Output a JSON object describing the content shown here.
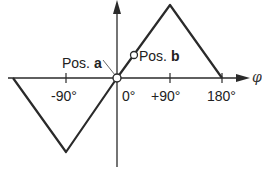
{
  "diagram": {
    "axis": {
      "x_symbol": "φ",
      "ticks": [
        {
          "label": "-90°",
          "value": -90
        },
        {
          "label": "0°",
          "value": 0
        },
        {
          "label": "+90°",
          "value": 90
        },
        {
          "label": "180°",
          "value": 180
        }
      ]
    },
    "positions": {
      "a": {
        "prefix": "Pos. ",
        "letter": "a"
      },
      "b": {
        "prefix": "Pos. ",
        "letter": "b"
      }
    },
    "curve": {
      "type": "triangular wave",
      "points_deg": [
        {
          "phi": -180,
          "y": 0
        },
        {
          "phi": -90,
          "y": -1
        },
        {
          "phi": 0,
          "y": 0
        },
        {
          "phi": 90,
          "y": 1
        },
        {
          "phi": 180,
          "y": 0
        }
      ]
    },
    "colors": {
      "line": "#2a2a2a",
      "text": "#222222",
      "background": "#ffffff"
    }
  }
}
